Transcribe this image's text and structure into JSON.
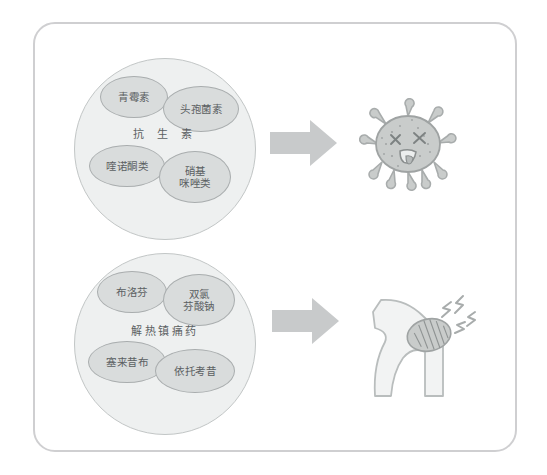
{
  "diagram": {
    "title_present": false,
    "frame": {
      "name": "rounded-card-frame",
      "border_color": "#cfcfd1"
    },
    "colors": {
      "group_circle_fill": "#eef0f0",
      "group_circle_stroke": "#c2c6c6",
      "drug_bubble_fill": "#d9dcdc",
      "drug_bubble_stroke": "#a9adae",
      "arrow_fill": "#c8cacb",
      "text": "#5b6062",
      "germ_fill": "#c9cccb",
      "knee_fill": "#f2f3f3",
      "knee_stroke": "#b9bdbd",
      "patella_fill": "#c9cccb"
    },
    "groups": [
      {
        "id": "antibiotics",
        "center_label": "抗 生 素",
        "drugs": [
          {
            "id": "penicillin",
            "label": "青霉素"
          },
          {
            "id": "cephalosporin",
            "label": "头孢菌素"
          },
          {
            "id": "quinolones",
            "label": "喹诺酮类"
          },
          {
            "id": "nitroimidazoles",
            "label": "硝基\n咪唑类"
          }
        ],
        "result": {
          "id": "dead-germ",
          "name": "dead-germ-illustration",
          "description": "germ with X eyes and tongue out"
        }
      },
      {
        "id": "antipyretic-analgesics",
        "center_label": "解热镇痛药",
        "drugs": [
          {
            "id": "ibuprofen",
            "label": "布洛芬"
          },
          {
            "id": "diclofenac-sodium",
            "label": "双氯\n芬酸钠"
          },
          {
            "id": "celecoxib",
            "label": "塞来昔布"
          },
          {
            "id": "etoricoxib",
            "label": "依托考昔"
          }
        ],
        "result": {
          "id": "painful-knee",
          "name": "painful-knee-illustration",
          "description": "bent knee joint with pain marks"
        }
      }
    ],
    "arrows": [
      {
        "id": "arrow-antibiotics",
        "direction": "right"
      },
      {
        "id": "arrow-analgesics",
        "direction": "right"
      }
    ]
  }
}
